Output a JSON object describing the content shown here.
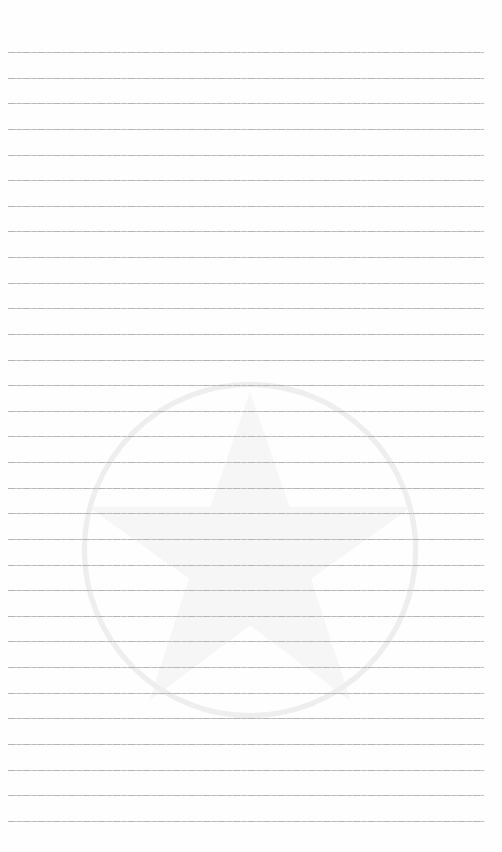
{
  "page": {
    "type": "lined-paper",
    "background_color": "#ffffff",
    "rule_color": "#aaaaaa",
    "rule_count": 31,
    "first_rule_y": 52,
    "rule_spacing": 25.63,
    "rule_left": 8,
    "rule_right": 484,
    "watermark": "star-emblem-icon"
  }
}
